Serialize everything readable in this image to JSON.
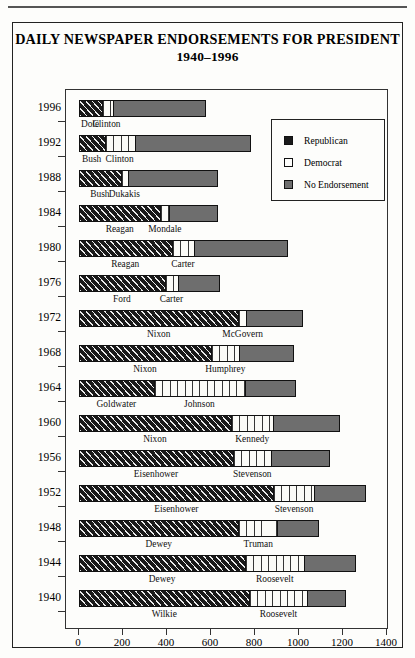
{
  "figure": {
    "title_line1": "DAILY NEWSPAPER ENDORSEMENTS FOR PRESIDENT",
    "title_line2": "1940–1996"
  },
  "legend": {
    "items": [
      {
        "label": "Republican",
        "color": "#1a1a1a",
        "icon": "square-swatch-republican"
      },
      {
        "label": "Democrat",
        "color": "#ffffff",
        "icon": "square-swatch-democrat"
      },
      {
        "label": "No Endorsement",
        "color": "#6e6e6e",
        "icon": "square-swatch-no-endorsement"
      }
    ]
  },
  "chart_data": {
    "type": "bar",
    "title": "DAILY NEWSPAPER ENDORSEMENTS FOR PRESIDENT 1940–1996",
    "orientation": "horizontal",
    "stacked": true,
    "xlabel": "",
    "ylabel": "",
    "xlim": [
      0,
      1400
    ],
    "xticks": [
      0,
      200,
      400,
      600,
      800,
      1000,
      1200,
      1400
    ],
    "grid": false,
    "legend_position": "upper right inside",
    "categories": [
      "1996",
      "1992",
      "1988",
      "1984",
      "1980",
      "1976",
      "1972",
      "1968",
      "1964",
      "1960",
      "1956",
      "1952",
      "1948",
      "1944",
      "1940"
    ],
    "series": [
      {
        "name": "Republican",
        "color": "#1a1a1a",
        "values": [
          100,
          115,
          190,
          370,
          420,
          390,
          725,
          600,
          340,
          690,
          700,
          885,
          725,
          755,
          775
        ]
      },
      {
        "name": "Democrat",
        "color": "#ffffff",
        "values": [
          50,
          140,
          32,
          40,
          105,
          60,
          38,
          130,
          415,
          195,
          175,
          185,
          180,
          270,
          263
        ]
      },
      {
        "name": "No Endorsement",
        "color": "#6e6e6e",
        "values": [
          428,
          525,
          410,
          222,
          425,
          190,
          255,
          246,
          230,
          300,
          265,
          235,
          185,
          233,
          177
        ]
      }
    ],
    "totals": [
      578,
      780,
      632,
      632,
      950,
      640,
      1018,
      976,
      985,
      1185,
      1140,
      1305,
      1090,
      1258,
      1215
    ],
    "candidates": [
      {
        "year": "1996",
        "republican": "Dole",
        "democrat": "Clinton"
      },
      {
        "year": "1992",
        "republican": "Bush",
        "democrat": "Clinton"
      },
      {
        "year": "1988",
        "republican": "Bush",
        "democrat": "Dukakis"
      },
      {
        "year": "1984",
        "republican": "Reagan",
        "democrat": "Mondale"
      },
      {
        "year": "1980",
        "republican": "Reagan",
        "democrat": "Carter"
      },
      {
        "year": "1976",
        "republican": "Ford",
        "democrat": "Carter"
      },
      {
        "year": "1972",
        "republican": "Nixon",
        "democrat": "McGovern"
      },
      {
        "year": "1968",
        "republican": "Nixon",
        "democrat": "Humphrey"
      },
      {
        "year": "1964",
        "republican": "Goldwater",
        "democrat": "Johnson"
      },
      {
        "year": "1960",
        "republican": "Nixon",
        "democrat": "Kennedy"
      },
      {
        "year": "1956",
        "republican": "Eisenhower",
        "democrat": "Stevenson"
      },
      {
        "year": "1952",
        "republican": "Eisenhower",
        "democrat": "Stevenson"
      },
      {
        "year": "1948",
        "republican": "Dewey",
        "democrat": "Truman"
      },
      {
        "year": "1944",
        "republican": "Dewey",
        "democrat": "Roosevelt"
      },
      {
        "year": "1940",
        "republican": "Wilkie",
        "democrat": "Roosevelt"
      }
    ]
  }
}
